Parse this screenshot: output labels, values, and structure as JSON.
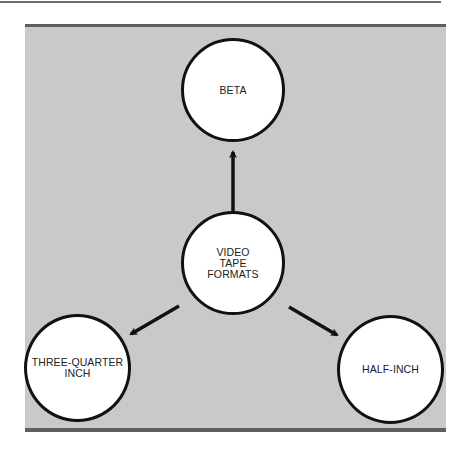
{
  "diagram": {
    "center": {
      "label": "VIDEO\nTAPE\nFORMATS"
    },
    "nodes": [
      {
        "id": "beta",
        "label": "BETA"
      },
      {
        "id": "three-quarter-inch",
        "label": "THREE-QUARTER\nINCH"
      },
      {
        "id": "half-inch",
        "label": "HALF-INCH"
      }
    ],
    "edges": [
      {
        "from": "center",
        "to": "beta"
      },
      {
        "from": "center",
        "to": "three-quarter-inch"
      },
      {
        "from": "center",
        "to": "half-inch"
      }
    ]
  },
  "colors": {
    "panel": "#c9c9c9",
    "rule": "#5e5e5e",
    "stroke": "#111111",
    "node_fill": "#ffffff"
  }
}
